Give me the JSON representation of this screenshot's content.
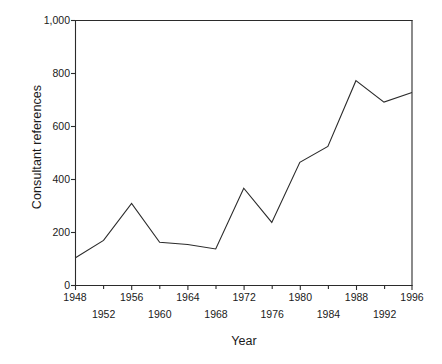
{
  "chart_data": {
    "type": "line",
    "title": "",
    "xlabel": "Year",
    "ylabel": "Consultant references",
    "x": [
      1948,
      1952,
      1956,
      1960,
      1964,
      1968,
      1972,
      1976,
      1980,
      1984,
      1988,
      1992,
      1996
    ],
    "values": [
      105,
      170,
      310,
      163,
      155,
      138,
      367,
      238,
      465,
      525,
      773,
      692,
      728
    ],
    "series": [
      {
        "name": "Consultant references",
        "values": [
          105,
          170,
          310,
          163,
          155,
          138,
          367,
          238,
          465,
          525,
          773,
          692,
          728
        ]
      }
    ],
    "xlim": [
      1948,
      1996
    ],
    "ylim": [
      0,
      1000
    ],
    "xticks": [
      1948,
      1952,
      1956,
      1960,
      1964,
      1968,
      1972,
      1976,
      1980,
      1984,
      1988,
      1992,
      1996
    ],
    "xtick_labels_upper": [
      "1948",
      "1956",
      "1964",
      "1972",
      "1980",
      "1988",
      "1996"
    ],
    "xtick_labels_lower": [
      "1952",
      "1960",
      "1968",
      "1976",
      "1984",
      "1992"
    ],
    "yticks": [
      0,
      200,
      400,
      600,
      800,
      1000
    ],
    "ytick_labels": [
      "0",
      "200",
      "400",
      "600",
      "800",
      "1,000"
    ],
    "grid": false,
    "legend": false,
    "line_color": "#2b2b2b",
    "background_color": "#ffffff"
  },
  "axes": {
    "y_title": "Consultant references",
    "x_title": "Year"
  }
}
